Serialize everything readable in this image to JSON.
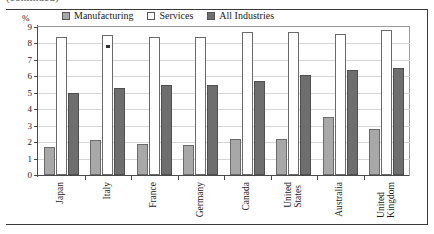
{
  "figure": {
    "caption_remnant": "(continued)",
    "unit_label": "%"
  },
  "legend": {
    "position": "top-center",
    "entries": [
      {
        "label": "Manufacturing",
        "color": "#a8a8a8",
        "swatch": "filled-light-gray-square"
      },
      {
        "label": "Services",
        "color": "#ffffff",
        "swatch": "open-white-square"
      },
      {
        "label": "All Industries",
        "color": "#6e6e6e",
        "swatch": "filled-dark-gray-square"
      }
    ]
  },
  "axis": {
    "y_ticks": [
      "0",
      "1",
      "2",
      "3",
      "4",
      "5",
      "6",
      "7",
      "8",
      "9"
    ],
    "x_categories": [
      {
        "lines": [
          "Japan"
        ]
      },
      {
        "lines": [
          "Italy"
        ]
      },
      {
        "lines": [
          "France"
        ]
      },
      {
        "lines": [
          "Germany"
        ]
      },
      {
        "lines": [
          "Canada"
        ]
      },
      {
        "lines": [
          "United",
          "States"
        ]
      },
      {
        "lines": [
          "Australia"
        ]
      },
      {
        "lines": [
          "United",
          "Kingdom"
        ]
      }
    ]
  },
  "annotations": {
    "italy_services_marker": "footnote-marker-square"
  },
  "chart_data": {
    "type": "bar",
    "title": "",
    "subtitle": "",
    "xlabel": "",
    "ylabel": "%",
    "ylim": [
      0,
      9
    ],
    "ytick_interval": 1,
    "grid": true,
    "legend_position": "top-center",
    "orientation": "vertical-grouped",
    "categories": [
      "Japan",
      "Italy",
      "France",
      "Germany",
      "Canada",
      "United States",
      "Australia",
      "United Kingdom"
    ],
    "series": [
      {
        "name": "Manufacturing",
        "color": "#a8a8a8",
        "values": [
          1.7,
          2.1,
          1.9,
          1.8,
          2.2,
          2.2,
          3.5,
          2.8
        ]
      },
      {
        "name": "Services",
        "color": "#ffffff",
        "values": [
          8.4,
          8.5,
          8.4,
          8.4,
          8.7,
          8.7,
          8.6,
          8.8
        ]
      },
      {
        "name": "All Industries",
        "color": "#6e6e6e",
        "values": [
          5.0,
          5.3,
          5.5,
          5.5,
          5.7,
          6.1,
          6.4,
          6.5
        ]
      }
    ]
  }
}
